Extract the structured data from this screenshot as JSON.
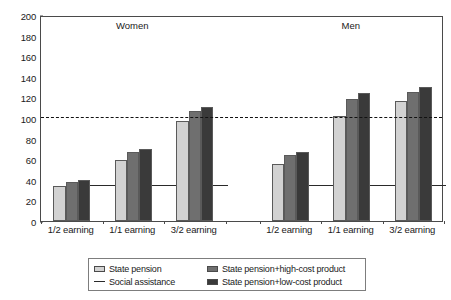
{
  "chart_data": {
    "type": "bar",
    "title": "",
    "subtitle": "",
    "xlabel": "",
    "ylabel": "",
    "ylim": [
      0,
      200
    ],
    "yticks": [
      0,
      20,
      40,
      60,
      80,
      100,
      120,
      140,
      160,
      180,
      200
    ],
    "grid": false,
    "legend_position": "bottom",
    "panels": [
      {
        "name": "Women",
        "categories": [
          "1/2 earning",
          "1/1 earning",
          "3/2 earning"
        ],
        "series": [
          {
            "name": "State pension",
            "values": [
              34,
              59,
              97
            ]
          },
          {
            "name": "State pension+high-cost product",
            "values": [
              38,
              67,
              107
            ]
          },
          {
            "name": "State pension+low-cost product",
            "values": [
              40,
              70,
              111
            ]
          }
        ],
        "social_assistance": 34
      },
      {
        "name": "Men",
        "categories": [
          "1/2 earning",
          "1/1 earning",
          "3/2 earning"
        ],
        "series": [
          {
            "name": "State pension",
            "values": [
              55,
              102,
              117
            ]
          },
          {
            "name": "State pension+high-cost product",
            "values": [
              64,
              118,
              125
            ]
          },
          {
            "name": "State pension+low-cost product",
            "values": [
              67,
              124,
              130
            ]
          }
        ],
        "social_assistance": 34
      }
    ],
    "reference_lines": [
      {
        "name": "replacement-100",
        "value": 100,
        "style": "dashed"
      },
      {
        "name": "social-assistance",
        "value": 34,
        "style": "solid"
      }
    ],
    "legend": [
      {
        "label": "State pension",
        "marker": "swatch",
        "color": "#d2d2d2"
      },
      {
        "label": "State pension+high-cost product",
        "marker": "swatch",
        "color": "#6f6f6f"
      },
      {
        "label": "Social assistance",
        "marker": "line",
        "color": "#2a2a2a"
      },
      {
        "label": "State pension+low-cost product",
        "marker": "swatch",
        "color": "#3a3a3a"
      }
    ],
    "colors": {
      "state_pension": "#d2d2d2",
      "high_cost": "#6f6f6f",
      "low_cost": "#3a3a3a",
      "axis": "#4a4a4a",
      "reference": "#111111",
      "background": "#ffffff"
    }
  }
}
